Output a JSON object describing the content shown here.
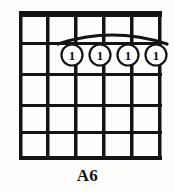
{
  "diagram": {
    "kind": "guitar-chord-diagram",
    "chord_name": "A6",
    "strings": 6,
    "frets": 5,
    "nut_shown": true,
    "ink_color": "#141414",
    "background_color": "#fdfdfb",
    "barre": {
      "shown": true,
      "fret": 1,
      "from_string": 2,
      "to_string": 5,
      "style": "arc"
    },
    "fingerings": [
      {
        "string": 2,
        "fret": 1,
        "finger": "1"
      },
      {
        "string": 3,
        "fret": 1,
        "finger": "1"
      },
      {
        "string": 4,
        "fret": 1,
        "finger": "1"
      },
      {
        "string": 5,
        "fret": 1,
        "finger": "1"
      }
    ],
    "finger_labels": [
      "1",
      "1",
      "1",
      "1"
    ]
  }
}
